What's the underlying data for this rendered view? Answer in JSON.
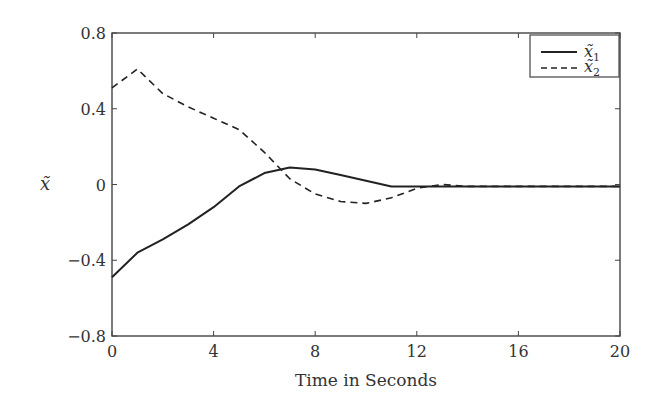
{
  "chart_data": {
    "type": "line",
    "title": "",
    "xlabel": "Time in Seconds",
    "ylabel": "x̃",
    "xlim": [
      0,
      20
    ],
    "ylim": [
      -0.8,
      0.8
    ],
    "xticks": [
      0,
      4,
      8,
      12,
      16,
      20
    ],
    "yticks": [
      0.8,
      0.4,
      0,
      -0.4,
      -0.8
    ],
    "xtick_labels": [
      "0",
      "4",
      "8",
      "12",
      "16",
      "20"
    ],
    "ytick_labels": [
      "0.8",
      "0.4",
      "0",
      "−0.4",
      "−0.8"
    ],
    "grid": false,
    "legend_position": "upper right",
    "series": [
      {
        "name": "x̃1",
        "style": "solid",
        "x": [
          0,
          1,
          2,
          3,
          4,
          5,
          6,
          7,
          8,
          9,
          10,
          11,
          12,
          13,
          14,
          16,
          18,
          20
        ],
        "y": [
          -0.49,
          -0.36,
          -0.29,
          -0.21,
          -0.12,
          -0.01,
          0.06,
          0.09,
          0.08,
          0.05,
          0.02,
          -0.01,
          -0.01,
          -0.01,
          -0.01,
          -0.01,
          -0.01,
          -0.01
        ]
      },
      {
        "name": "x̃2",
        "style": "dashed",
        "x": [
          0,
          1,
          2,
          3,
          4,
          5,
          6,
          7,
          8,
          9,
          10,
          11,
          12,
          13,
          14,
          16,
          18,
          20
        ],
        "y": [
          0.51,
          0.61,
          0.48,
          0.41,
          0.35,
          0.29,
          0.17,
          0.03,
          -0.05,
          -0.09,
          -0.1,
          -0.07,
          -0.02,
          0.0,
          -0.01,
          -0.01,
          -0.01,
          -0.01
        ]
      }
    ]
  },
  "legend": {
    "items": [
      {
        "label_base": "x̃",
        "label_sub": "1",
        "style": "solid"
      },
      {
        "label_base": "x̃",
        "label_sub": "2",
        "style": "dashed"
      }
    ]
  },
  "axes": {
    "xlabel": "Time in Seconds",
    "ylabel": "x̃"
  }
}
